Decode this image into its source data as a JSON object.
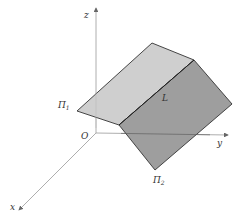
{
  "diagram": {
    "type": "3d-intersecting-planes",
    "axes": {
      "x_label": "x",
      "y_label": "y",
      "z_label": "z",
      "origin_label": "O"
    },
    "planes": [
      {
        "name": "plane-1",
        "label": "Π",
        "subscript": "1",
        "fill": "#cfcfcf"
      },
      {
        "name": "plane-2",
        "label": "Π",
        "subscript": "2",
        "fill": "#9e9e9e"
      }
    ],
    "intersection_line_label": "L",
    "colors": {
      "axis": "#888888",
      "edge": "#333333",
      "text": "#333333",
      "background": "#ffffff"
    }
  }
}
